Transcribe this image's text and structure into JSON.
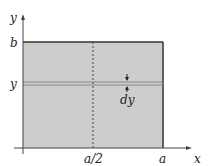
{
  "diagram": {
    "labels": {
      "y_axis": "y",
      "x_axis": "x",
      "top": "b",
      "strip_y": "y",
      "strip_width": "dy",
      "mid": "a/2",
      "right": "a"
    },
    "colors": {
      "fill": "#cdcdcd",
      "edge": "#333333",
      "strip": "#888888"
    }
  }
}
